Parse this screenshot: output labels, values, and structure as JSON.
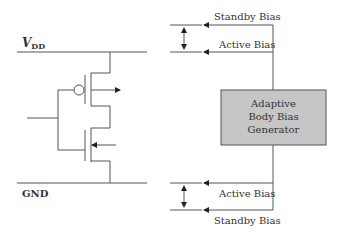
{
  "diagram": {
    "rails": {
      "vdd": {
        "label_main": "V",
        "label_sub": "DD"
      },
      "gnd": {
        "label": "GND"
      }
    },
    "generator": {
      "lines": [
        "Adaptive",
        "Body Bias",
        "Generator"
      ],
      "fill": "#c6c6c6",
      "stroke": "#555555"
    },
    "bias_labels": {
      "top_standby": "Standby Bias",
      "top_active": "Active Bias",
      "bottom_active": "Active Bias",
      "bottom_standby": "Standby Bias"
    },
    "colors": {
      "line": "#555555",
      "text": "#333333"
    }
  }
}
